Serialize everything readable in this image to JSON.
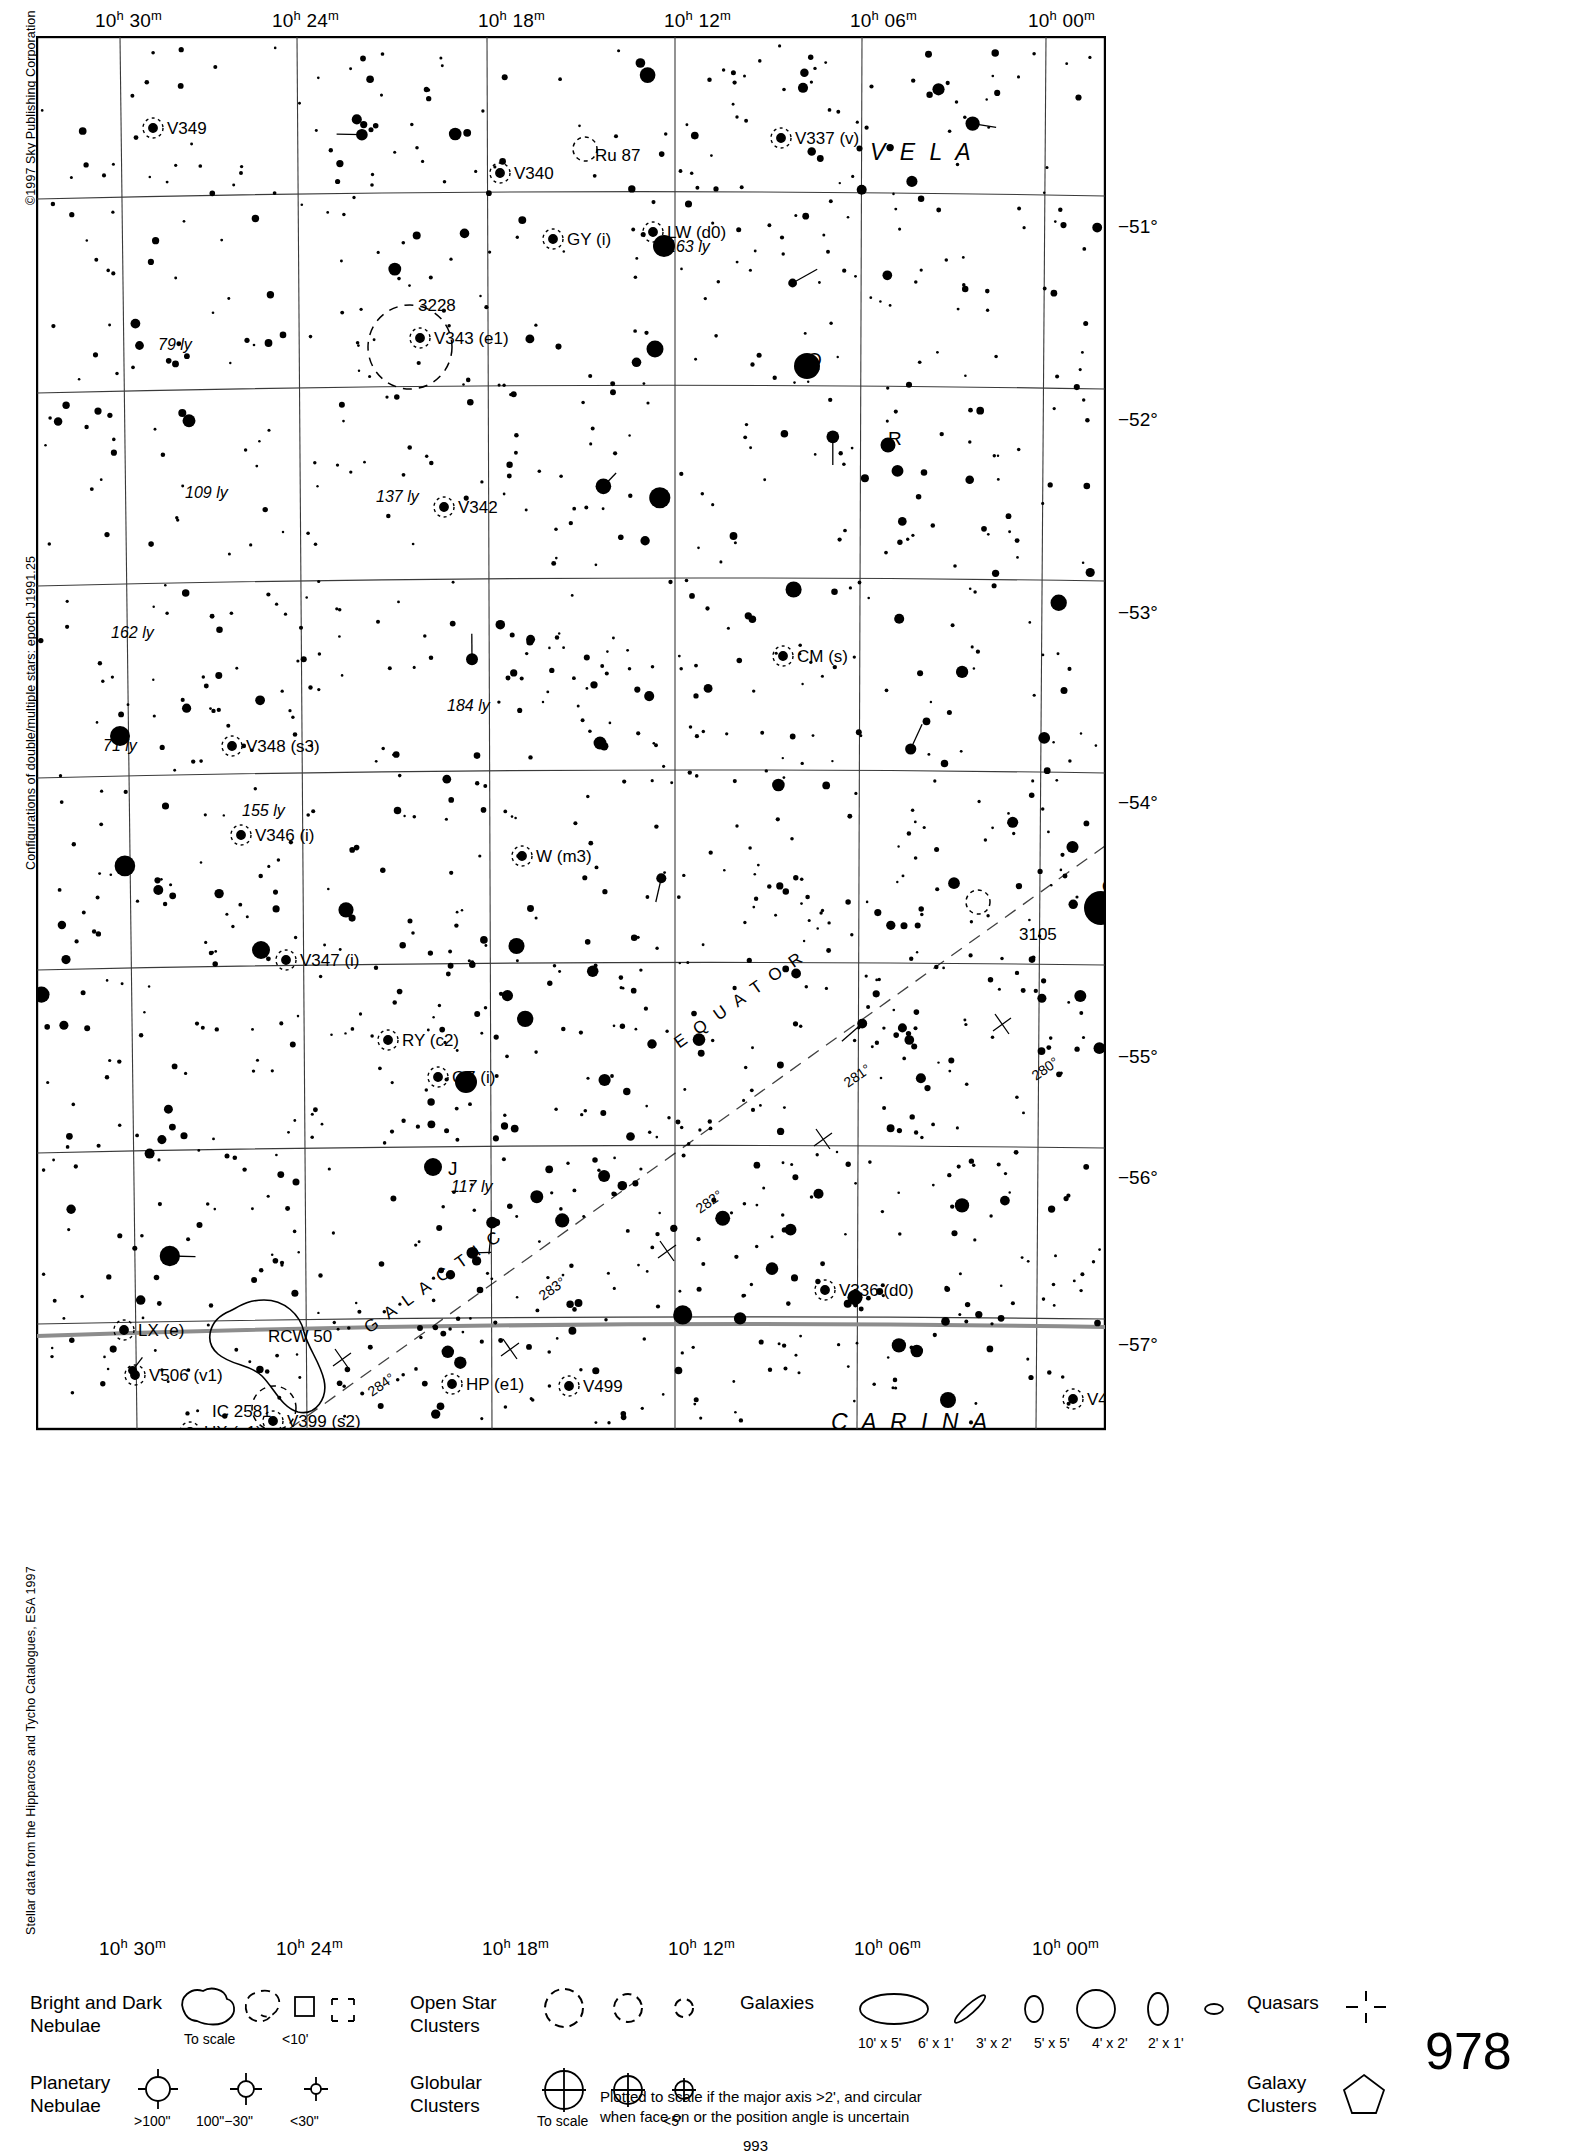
{
  "meta": {
    "copyright_left": "©1997 Sky Publishing Corporation",
    "credit_mid": "Configurations of double/multiple stars: epoch J1991.25",
    "credit_low": "Stellar data from the Hipparcos and Tycho Catalogues, ESA 1997",
    "page_number": "978",
    "footer_number": "993"
  },
  "axes": {
    "ra_ticks": [
      {
        "label_h": "10",
        "label_m": "30",
        "x": 107
      },
      {
        "label_h": "10",
        "label_m": "24",
        "x": 284
      },
      {
        "label_h": "10",
        "label_m": "18",
        "x": 490
      },
      {
        "label_h": "10",
        "label_m": "12",
        "x": 676
      },
      {
        "label_h": "10",
        "label_m": "06",
        "x": 862
      },
      {
        "label_h": "10",
        "label_m": "00",
        "x": 1040
      }
    ],
    "dec_ticks": [
      {
        "label": "−51°",
        "y": 192
      },
      {
        "label": "−52°",
        "y": 385
      },
      {
        "label": "−53°",
        "y": 578
      },
      {
        "label": "−54°",
        "y": 768
      },
      {
        "label": "−55°",
        "y": 1022
      },
      {
        "label": "−56°",
        "y": 1143
      },
      {
        "label": "−57°",
        "y": 1310
      }
    ]
  },
  "constellations": [
    {
      "name": "V E L A",
      "x": 868,
      "y": 118
    },
    {
      "name": "C A R I N A",
      "x": 830,
      "y": 1388
    }
  ],
  "galactic": {
    "equator_label": "E Q U A T O R",
    "galactic_label": "G A L A C T I C",
    "ticks": [
      {
        "label": "280°",
        "x": 1000,
        "y": 1045
      },
      {
        "label": "281°",
        "x": 812,
        "y": 1052
      },
      {
        "label": "282°",
        "x": 664,
        "y": 1178
      },
      {
        "label": "283°",
        "x": 507,
        "y": 1265
      },
      {
        "label": "284°",
        "x": 336,
        "y": 1361
      }
    ]
  },
  "objects": [
    {
      "label": "V349",
      "x": 131,
      "y": 98,
      "type": "variable"
    },
    {
      "label": "V340",
      "x": 478,
      "y": 143,
      "type": "variable"
    },
    {
      "label": "Ru 87",
      "x": 559,
      "y": 125,
      "type": "open-cluster"
    },
    {
      "label": "V337 (v)",
      "x": 759,
      "y": 108,
      "type": "variable"
    },
    {
      "label": "GY (i)",
      "x": 531,
      "y": 209,
      "type": "variable"
    },
    {
      "label": "LW (d0)",
      "x": 631,
      "y": 202,
      "type": "variable"
    },
    {
      "label": "163 ly",
      "x": 631,
      "y": 216,
      "type": "distance"
    },
    {
      "label": "3228",
      "x": 382,
      "y": 275,
      "type": "open-cluster"
    },
    {
      "label": "V343 (e1)",
      "x": 398,
      "y": 308,
      "type": "variable"
    },
    {
      "label": "79 ly",
      "x": 122,
      "y": 314,
      "type": "distance"
    },
    {
      "label": "Q",
      "x": 771,
      "y": 330,
      "type": "star-letter"
    },
    {
      "label": "R",
      "x": 852,
      "y": 409,
      "type": "star-letter"
    },
    {
      "label": "109 ly",
      "x": 149,
      "y": 462,
      "type": "distance"
    },
    {
      "label": "137 ly",
      "x": 340,
      "y": 466,
      "type": "distance"
    },
    {
      "label": "V342",
      "x": 422,
      "y": 477,
      "type": "variable"
    },
    {
      "label": "162 ly",
      "x": 75,
      "y": 602,
      "type": "distance"
    },
    {
      "label": "CM (s)",
      "x": 761,
      "y": 626,
      "type": "variable"
    },
    {
      "label": "184 ly",
      "x": 411,
      "y": 675,
      "type": "distance"
    },
    {
      "label": "71 ly",
      "x": 67,
      "y": 715,
      "type": "distance"
    },
    {
      "label": "V348 (s3)",
      "x": 210,
      "y": 716,
      "type": "variable"
    },
    {
      "label": "155 ly",
      "x": 206,
      "y": 780,
      "type": "distance"
    },
    {
      "label": "V346 (i)",
      "x": 219,
      "y": 805,
      "type": "variable"
    },
    {
      "label": "W (m3)",
      "x": 500,
      "y": 826,
      "type": "variable"
    },
    {
      "label": "φ",
      "x": 1066,
      "y": 855,
      "type": "star-letter"
    },
    {
      "label": "3105",
      "x": 983,
      "y": 904,
      "type": "open-cluster"
    },
    {
      "label": "V347 (i)",
      "x": 264,
      "y": 930,
      "type": "variable"
    },
    {
      "label": "GZ (i)",
      "x": 416,
      "y": 1047,
      "type": "variable"
    },
    {
      "label": "RY (c2)",
      "x": 366,
      "y": 1010,
      "type": "variable"
    },
    {
      "label": "J",
      "x": 412,
      "y": 1139,
      "type": "star-letter"
    },
    {
      "label": "117 ly",
      "x": 415,
      "y": 1156,
      "type": "distance"
    },
    {
      "label": "V336 (d0)",
      "x": 803,
      "y": 1260,
      "type": "variable"
    },
    {
      "label": "LX (e)",
      "x": 102,
      "y": 1300,
      "type": "variable"
    },
    {
      "label": "RCW 50",
      "x": 232,
      "y": 1306,
      "type": "nebula"
    },
    {
      "label": "V506 (v1)",
      "x": 113,
      "y": 1345,
      "type": "variable"
    },
    {
      "label": "HP (e1)",
      "x": 430,
      "y": 1354,
      "type": "variable"
    },
    {
      "label": "V499",
      "x": 547,
      "y": 1356,
      "type": "variable"
    },
    {
      "label": "V423",
      "x": 1051,
      "y": 1369,
      "type": "variable"
    },
    {
      "label": "IC 2581",
      "x": 176,
      "y": 1381,
      "type": "open-cluster"
    },
    {
      "label": "V399 (s2)",
      "x": 251,
      "y": 1391,
      "type": "variable"
    },
    {
      "label": "UX (c1)",
      "x": 168,
      "y": 1402,
      "type": "variable"
    },
    {
      "label": "V504",
      "x": 263,
      "y": 1412,
      "type": "variable"
    }
  ],
  "legend": {
    "rows": [
      {
        "name": "nebulae",
        "title_line1": "Bright and Dark",
        "title_line2": "Nebulae",
        "captions": [
          {
            "text": "To scale",
            "x": 178,
            "y": 71
          },
          {
            "text": "<10'",
            "x": 277,
            "y": 71
          }
        ]
      },
      {
        "name": "planetary-nebulae",
        "title_line1": "Planetary",
        "title_line2": "Nebulae",
        "captions": [
          {
            "text": ">100\"",
            "x": 143,
            "y": 66
          },
          {
            "text": "100\"−30\"",
            "x": 190,
            "y": 66
          },
          {
            "text": "<30\"",
            "x": 265,
            "y": 66
          }
        ]
      },
      {
        "name": "open-star-clusters",
        "title_line1": "Open Star",
        "title_line2": "Clusters",
        "captions": []
      },
      {
        "name": "globular-clusters",
        "title_line1": "Globular",
        "title_line2": "Clusters",
        "captions": [
          {
            "text": "To scale",
            "x": 398,
            "y": 160
          },
          {
            "text": "<5'",
            "x": 488,
            "y": 160
          }
        ]
      },
      {
        "name": "galaxies",
        "title_line1": "Galaxies",
        "title_line2": "",
        "captions": [
          {
            "text": "10' x 5'",
            "x": 600,
            "y": 0
          },
          {
            "text": "6' x 1'",
            "x": 660,
            "y": 0
          },
          {
            "text": "3' x 2'",
            "x": 718,
            "y": 0
          },
          {
            "text": "5' x 5'",
            "x": 776,
            "y": 0
          },
          {
            "text": "4' x 2'",
            "x": 834,
            "y": 0
          },
          {
            "text": "2' x 1'",
            "x": 890,
            "y": 0
          }
        ],
        "note_line1": "Plotted to scale if the major axis >2', and circular",
        "note_line2": "when face on or the position angle is uncertain"
      },
      {
        "name": "quasars",
        "title_line1": "Quasars",
        "title_line2": "",
        "captions": []
      },
      {
        "name": "galaxy-clusters",
        "title_line1": "Galaxy",
        "title_line2": "Clusters",
        "captions": []
      }
    ]
  },
  "chart_data": {
    "type": "scatter",
    "xlabel": "Right Ascension (J2000)",
    "ylabel": "Declination (J2000)",
    "xlim": [
      "10h 32m",
      "09h 58m"
    ],
    "ylim": [
      -57.4,
      -50.5
    ],
    "grid": true,
    "legend_position": "bottom",
    "ra_gridlines": [
      "10h 30m",
      "10h 24m",
      "10h 18m",
      "10h 12m",
      "10h 06m",
      "10h 00m"
    ],
    "dec_gridlines": [
      -51,
      -52,
      -53,
      -54,
      -55,
      -56,
      -57
    ],
    "star_magnitude_sizes": [
      {
        "mag": "≤2",
        "radius_px": 13
      },
      {
        "mag": "3",
        "radius_px": 9
      },
      {
        "mag": "4",
        "radius_px": 7
      },
      {
        "mag": "5",
        "radius_px": 5.5
      },
      {
        "mag": "6",
        "radius_px": 4.2
      },
      {
        "mag": "7",
        "radius_px": 3.2
      },
      {
        "mag": "8",
        "radius_px": 2.4
      },
      {
        "mag": "9",
        "radius_px": 1.7
      },
      {
        "mag": "10",
        "radius_px": 1.2
      }
    ],
    "star_count_plotted": 1850,
    "notable_objects": [
      {
        "name": "NGC 3228",
        "kind": "open cluster",
        "ra": "10h 21.4m",
        "dec": "-51.7"
      },
      {
        "name": "Ru 87",
        "kind": "open cluster",
        "ra": "10h 14.5m",
        "dec": "-50.7"
      },
      {
        "name": "IC 2581",
        "kind": "open cluster",
        "ra": "10h 27.4m",
        "dec": "-57.6"
      },
      {
        "name": "Cr 3105",
        "kind": "open cluster",
        "ra": "10h 03.0m",
        "dec": "-54.8"
      },
      {
        "name": "RCW 50",
        "kind": "bright nebula",
        "ra": "10h 28m",
        "dec": "-57.1"
      },
      {
        "name": "phi Vel",
        "kind": "bright star",
        "ra": "09h 56.9m",
        "dec": "-54.6"
      },
      {
        "name": "Q Vel",
        "kind": "bright star",
        "ra": "10h 09.4m",
        "dec": "-51.8"
      }
    ]
  }
}
